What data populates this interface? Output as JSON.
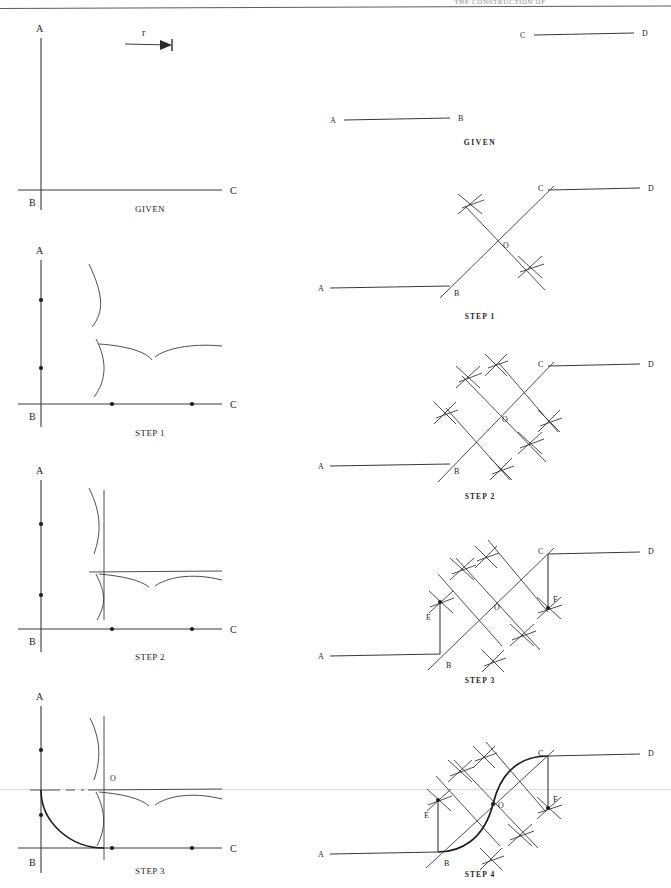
{
  "page": {
    "header_title": "THE CONSTRUCTION OF",
    "width": 671,
    "height": 888,
    "ink_color": "#1d1d1d",
    "paper_color": "#ffffff",
    "scan_artifact_color": "#dcdcdc"
  },
  "left_column": {
    "title": "Arc tangent construction",
    "figures": [
      {
        "caption": "GIVEN",
        "point_labels": [
          "A",
          "B",
          "C"
        ],
        "radius_label": "r",
        "description": "Vertical line A-B and horizontal line B-C forming a right angle, with a radius measure r shown as a dimension arrow"
      },
      {
        "caption": "STEP 1",
        "point_labels": [
          "A",
          "B",
          "C"
        ],
        "description": "Arcs struck from radius r marking points on line AB and line BC"
      },
      {
        "caption": "STEP 2",
        "point_labels": [
          "A",
          "B",
          "C"
        ],
        "description": "Construction lines drawn parallel to AB and BC at distance r"
      },
      {
        "caption": "STEP 3",
        "point_labels": [
          "A",
          "B",
          "C",
          "O"
        ],
        "center_label": "O",
        "description": "Center O located at the intersection; tangent arc of radius r drawn joining AB and BC"
      }
    ]
  },
  "right_column": {
    "title": "Reverse curve construction",
    "figures": [
      {
        "caption": "GIVEN",
        "point_labels": [
          "A",
          "B",
          "C",
          "D"
        ],
        "description": "Two parallel line segments A-B and C-D offset from each other"
      },
      {
        "caption": "STEP 1",
        "point_labels": [
          "A",
          "B",
          "C",
          "D",
          "O"
        ],
        "center_label": "O",
        "description": "Line BC drawn and bisected at midpoint O with intersecting arcs"
      },
      {
        "caption": "STEP 2",
        "point_labels": [
          "A",
          "B",
          "C",
          "D",
          "O"
        ],
        "center_label": "O",
        "description": "Perpendicular bisectors of BO and OC constructed with arc crosses"
      },
      {
        "caption": "STEP 3",
        "point_labels": [
          "A",
          "B",
          "C",
          "D",
          "E",
          "F",
          "O"
        ],
        "center_label": "O",
        "description": "Perpendiculars erected at B and C intersecting bisectors at centers E and F"
      },
      {
        "caption": "STEP 4",
        "point_labels": [
          "A",
          "B",
          "C",
          "D",
          "E",
          "F",
          "O"
        ],
        "center_label": "O",
        "description": "Reverse curve drawn: arc from B to O about E and arc from O to C about F"
      }
    ]
  }
}
